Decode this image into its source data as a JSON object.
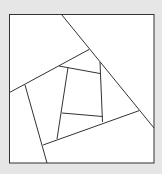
{
  "diagram": {
    "background_color": "#e6e6e6",
    "fill_color": "#ffffff",
    "stroke_color": "#333333",
    "shapes": {
      "outer_square": "square frame",
      "regions": 9
    }
  }
}
